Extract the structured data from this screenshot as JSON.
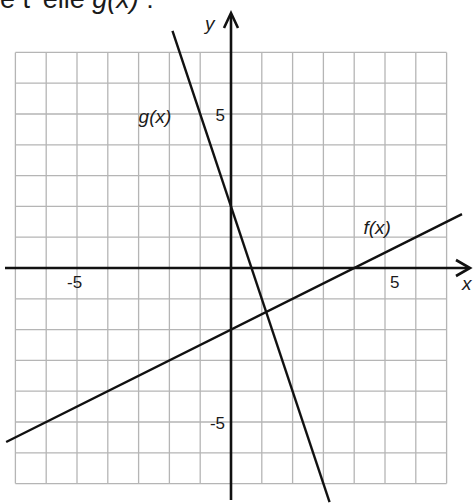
{
  "question": {
    "text_prefix": "e t' elle ",
    "function_ref": "g(x)",
    "text_suffix": " :"
  },
  "chart_data": {
    "type": "line",
    "title": "",
    "xlabel": "x",
    "ylabel": "y",
    "xlim": [
      -7,
      7
    ],
    "ylim": [
      -7,
      7
    ],
    "grid": true,
    "tick_labels": {
      "x": [
        {
          "value": -5,
          "label": "-5"
        },
        {
          "value": 5,
          "label": "5"
        }
      ],
      "y": [
        {
          "value": 5,
          "label": "5"
        },
        {
          "value": -5,
          "label": "-5"
        }
      ]
    },
    "series": [
      {
        "name": "f(x)",
        "equation": "f(x) = 0.5x - 2",
        "slope": 0.5,
        "intercept": -2,
        "points": [
          [
            -7.3,
            -5.65
          ],
          [
            0,
            -2
          ],
          [
            4,
            0
          ],
          [
            7.5,
            1.75
          ]
        ],
        "label_position": [
          4.3,
          1.1
        ]
      },
      {
        "name": "g(x)",
        "equation": "g(x) = -3x + 2",
        "slope": -3,
        "intercept": 2,
        "points": [
          [
            -1.9,
            7.7
          ],
          [
            0,
            2
          ],
          [
            0.667,
            0
          ],
          [
            3.2,
            -7.6
          ]
        ],
        "label_position": [
          -3,
          4.7
        ]
      }
    ],
    "intersection": [
      1.14,
      -1.43
    ]
  },
  "colors": {
    "grid": "#b5b5b5",
    "axis": "#111111",
    "line": "#111111",
    "background": "#ffffff"
  }
}
